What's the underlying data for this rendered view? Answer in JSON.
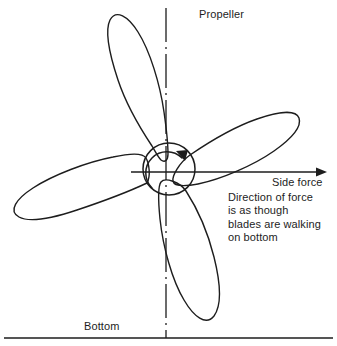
{
  "figure": {
    "type": "technical-diagram",
    "stroke_color": "#1d1d1d",
    "text_color": "#1d1d1d",
    "background_color": "#ffffff"
  },
  "labels": {
    "propeller": "Propeller",
    "side_force": "Side force",
    "bottom": "Bottom"
  },
  "note": {
    "lines": [
      "Direction of force",
      "is as though",
      "blades are walking",
      "on bottom"
    ]
  },
  "geometry": {
    "hub": {
      "cx": 169,
      "cy": 169,
      "r": 26
    },
    "centerline": {
      "x": 166,
      "y1": 8,
      "y2": 338
    },
    "side_force_arrow": {
      "x1": 131,
      "y1": 172,
      "x2": 327,
      "y2": 172
    },
    "bottom_line": {
      "x1": 4,
      "y1": 338,
      "x2": 333,
      "y2": 338
    },
    "rotation": "clockwise",
    "blade_count": 4,
    "blade_tips": [
      {
        "name": "upper-left-blade",
        "x": 112,
        "y": 16
      },
      {
        "name": "right-blade",
        "x": 292,
        "y": 116
      },
      {
        "name": "lower-left-blade",
        "x": 13,
        "y": 216
      },
      {
        "name": "lower-right-blade",
        "x": 213,
        "y": 326
      }
    ]
  }
}
